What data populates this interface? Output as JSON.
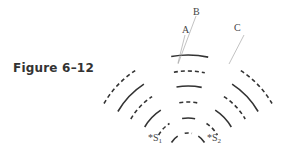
{
  "caption": "Figure 6–12",
  "labels": {
    "A": "A",
    "B": "B",
    "C": "C"
  },
  "sources": [
    {
      "star": "*",
      "name": "S",
      "sub": "1"
    },
    {
      "star": "*",
      "name": "S",
      "sub": "2"
    }
  ],
  "colors": {
    "ink": "#333333",
    "leader": "#999999"
  },
  "arc_groups": [
    {
      "name": "left",
      "pattern": [
        "solid",
        "dashed",
        "solid",
        "dashed",
        "solid",
        "dashed"
      ]
    },
    {
      "name": "center",
      "pattern": [
        "dashed",
        "solid",
        "dashed",
        "solid",
        "dashed",
        "solid"
      ]
    },
    {
      "name": "right",
      "pattern": [
        "solid",
        "dashed",
        "solid",
        "dashed",
        "solid",
        "dashed"
      ]
    }
  ]
}
